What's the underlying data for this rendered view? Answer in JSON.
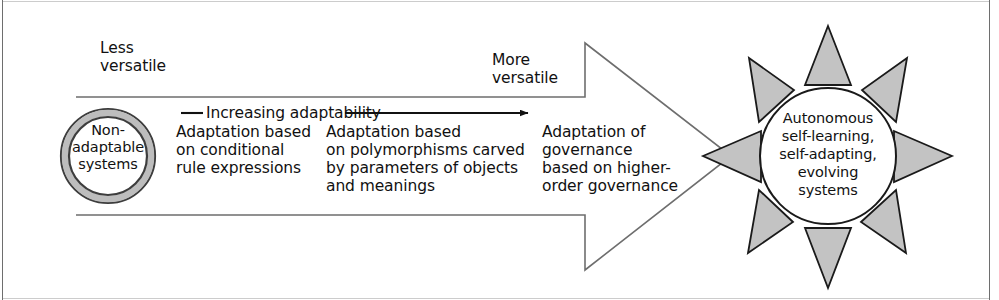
{
  "figure": {
    "colors": {
      "stroke": "#4d4d4d",
      "text": "#111111",
      "ray_fill": "#c3c3c3",
      "ray_stroke": "#1a1a1a",
      "ring_fill": "#bdbdbd",
      "ring_stroke": "#3d3d3d",
      "frame": "#6e6e6e"
    },
    "endpoints": {
      "less_versatile": "Less\nversatile",
      "more_versatile": "More\nversatile"
    },
    "axis": {
      "label": "Increasing adaptability",
      "direction": "left-to-right"
    },
    "start_node": {
      "label": "Non-\nadaptable\nsystems",
      "shape": "double-ring-circle"
    },
    "end_node": {
      "label": "Autonomous\nself-learning,\nself-adapting,\nevolving\nsystems",
      "shape": "sun-circle-with-rays",
      "ray_count": 8
    },
    "stages": [
      {
        "index": 1,
        "text": "Adaptation based\non conditional\nrule expressions"
      },
      {
        "index": 2,
        "text": "Adaptation based\non polymorphisms carved\nby parameters of objects\nand meanings"
      },
      {
        "index": 3,
        "text": "Adaptation of\ngovernance\nbased on higher-\norder governance"
      }
    ]
  }
}
